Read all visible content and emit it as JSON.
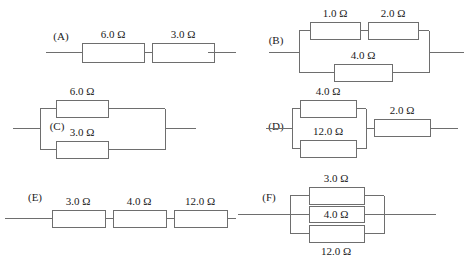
{
  "figure": {
    "kind": "resistor-network-diagrams",
    "unit_symbol": "Ω",
    "line_color": "#6e6e6e",
    "text_color": "#1c1c1c",
    "background_color": "#ffffff",
    "panel_count": 6
  },
  "panels": {
    "a": {
      "tag": "(A)",
      "topology": "series",
      "resistors": [
        {
          "label": "6.0 Ω",
          "value": 6.0,
          "position": "left"
        },
        {
          "label": "3.0 Ω",
          "value": 3.0,
          "position": "right"
        }
      ]
    },
    "b": {
      "tag": "(B)",
      "topology": "parallel-of-series-and-single",
      "resistors": [
        {
          "label": "1.0 Ω",
          "value": 1.0,
          "position": "top-left"
        },
        {
          "label": "2.0 Ω",
          "value": 2.0,
          "position": "top-right"
        },
        {
          "label": "4.0 Ω",
          "value": 4.0,
          "position": "bottom"
        }
      ]
    },
    "c": {
      "tag": "(C)",
      "topology": "parallel",
      "resistors": [
        {
          "label": "6.0 Ω",
          "value": 6.0,
          "position": "top"
        },
        {
          "label": "3.0 Ω",
          "value": 3.0,
          "position": "bottom"
        }
      ]
    },
    "d": {
      "tag": "(D)",
      "topology": "parallel-then-series",
      "resistors": [
        {
          "label": "4.0 Ω",
          "value": 4.0,
          "position": "top"
        },
        {
          "label": "12.0 Ω",
          "value": 12.0,
          "position": "bottom"
        },
        {
          "label": "2.0 Ω",
          "value": 2.0,
          "position": "series-right"
        }
      ]
    },
    "e": {
      "tag": "(E)",
      "topology": "series",
      "resistors": [
        {
          "label": "3.0 Ω",
          "value": 3.0,
          "position": "left"
        },
        {
          "label": "4.0 Ω",
          "value": 4.0,
          "position": "middle"
        },
        {
          "label": "12.0 Ω",
          "value": 12.0,
          "position": "right"
        }
      ]
    },
    "f": {
      "tag": "(F)",
      "topology": "parallel",
      "resistors": [
        {
          "label": "3.0 Ω",
          "value": 3.0,
          "position": "top"
        },
        {
          "label": "4.0 Ω",
          "value": 4.0,
          "position": "middle"
        },
        {
          "label": "12.0 Ω",
          "value": 12.0,
          "position": "bottom"
        }
      ]
    }
  }
}
